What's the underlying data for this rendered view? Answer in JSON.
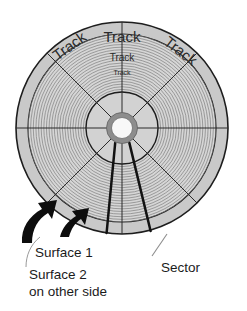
{
  "figure": {
    "kind": "disk-platter-diagram",
    "geometry": {
      "center_x": 122,
      "center_y": 128,
      "outer_radius": 106,
      "track_band_outer_radius": 94,
      "inner_hub_radius": 36,
      "hub_ring_outer_radius": 15,
      "hub_hole_radius": 10,
      "sector_count": 8,
      "track_ring_count": 22
    },
    "colors": {
      "platter_fill": "#c9c9c9",
      "track_band_fill": "#d4d4d4",
      "track_line": "#8e8e8e",
      "outline": "#1d1d1d",
      "hub_ring": "#8d8d8d",
      "hub_hole": "#f7f7f7",
      "arrow": "#0d0d0d",
      "leader_line": "#8a8a8a",
      "text": "#1b1b1b",
      "background": "#ffffff"
    }
  },
  "track_labels": [
    {
      "id": "track-outer-left",
      "text": "Track",
      "x": 70,
      "y": 47,
      "rotation": -36,
      "font_size": 15
    },
    {
      "id": "track-outer-top",
      "text": "Track",
      "x": 122,
      "y": 38,
      "rotation": 0,
      "font_size": 15
    },
    {
      "id": "track-outer-right",
      "text": "Track",
      "x": 180,
      "y": 52,
      "rotation": 38,
      "font_size": 15
    },
    {
      "id": "track-middle-top",
      "text": "Track",
      "x": 122,
      "y": 58,
      "rotation": 0,
      "font_size": 10
    },
    {
      "id": "track-inner-top",
      "text": "Track",
      "x": 122,
      "y": 73,
      "rotation": 0,
      "font_size": 7
    }
  ],
  "callouts": [
    {
      "id": "surface-1",
      "text": "Surface 1",
      "x": 35,
      "y": 257,
      "font_size": 14,
      "pointer": "thick-curved-arrow"
    },
    {
      "id": "surface-2",
      "text": "Surface 2",
      "x": 29,
      "y": 279,
      "font_size": 14,
      "pointer": "thin-leader-line"
    },
    {
      "id": "surface-2-continued",
      "text": "on other side",
      "x": 29,
      "y": 296,
      "font_size": 14,
      "pointer": "none"
    },
    {
      "id": "sector",
      "text": "Sector",
      "x": 161,
      "y": 272,
      "font_size": 14,
      "pointer": "thin-leader-line"
    }
  ],
  "annotations": {
    "highlighted_sector_label": "Sector",
    "arrow_count": 2,
    "arrow_targets": [
      "Surface 1",
      "Surface 2"
    ]
  }
}
